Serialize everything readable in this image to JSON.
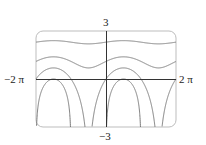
{
  "chart_data": {
    "type": "line",
    "title": "",
    "xlabel": "",
    "ylabel": "",
    "function_family": "y = ln(c + sin x)",
    "xlim": [
      -6.2832,
      6.2832
    ],
    "ylim": [
      -3,
      3
    ],
    "x_tick_labels": [
      "-2π",
      "2π"
    ],
    "y_tick_labels": [
      "-3",
      "3"
    ],
    "grid": false,
    "legend": null,
    "series": [
      {
        "name": "c = 10",
        "c": 10,
        "x": [
          -6.283,
          -4.712,
          -3.142,
          -1.571,
          0,
          1.571,
          3.142,
          4.712,
          6.283
        ],
        "y": [
          2.303,
          2.398,
          2.303,
          2.197,
          2.303,
          2.398,
          2.303,
          2.197,
          2.303
        ]
      },
      {
        "name": "c = 3",
        "c": 3,
        "x": [
          -6.283,
          -4.712,
          -3.142,
          -1.571,
          0,
          1.571,
          3.142,
          4.712,
          6.283
        ],
        "y": [
          1.099,
          1.386,
          1.099,
          0.693,
          1.099,
          1.386,
          1.099,
          0.693,
          1.099
        ]
      },
      {
        "name": "c = 1",
        "c": 1,
        "x": [
          -6.283,
          -4.712,
          -3.142,
          -1.571,
          0,
          1.571,
          3.142,
          4.712,
          6.283
        ],
        "y": [
          0,
          0.693,
          0,
          null,
          0,
          0.693,
          0,
          null,
          0
        ]
      },
      {
        "name": "c = 0",
        "c": 0,
        "x": [
          -6.283,
          -5.498,
          -4.712,
          -3.927,
          -3.142,
          0,
          0.785,
          1.571,
          2.356,
          3.142
        ],
        "y": [
          null,
          -0.347,
          0,
          -0.347,
          null,
          null,
          -0.347,
          0,
          -0.347,
          null
        ]
      }
    ],
    "style": {
      "curve_color": "#7a7a7a",
      "axis_color": "#333333",
      "frame_color": "#bdbdbd"
    }
  },
  "labels": {
    "ymax": "3",
    "ymin": "−3",
    "xmin": "−2 π",
    "xmax": "2 π"
  }
}
